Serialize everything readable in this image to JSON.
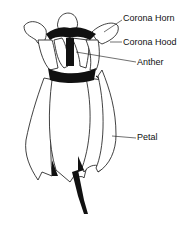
{
  "diagram": {
    "labels": [
      {
        "id": "corona-horn",
        "text": "Corona Horn"
      },
      {
        "id": "corona-hood",
        "text": "Corona Hood"
      },
      {
        "id": "anther",
        "text": "Anther"
      },
      {
        "id": "petal",
        "text": "Petal"
      }
    ]
  },
  "colors": {
    "ink": "#111111",
    "background": "#ffffff"
  }
}
